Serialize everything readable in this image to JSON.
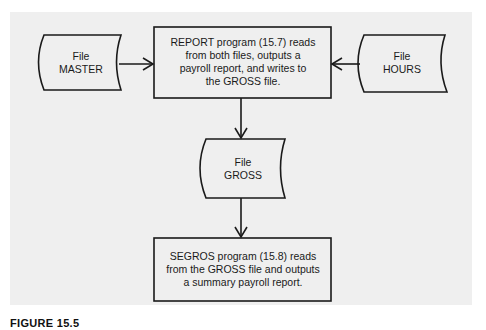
{
  "diagram": {
    "nodes": [
      {
        "id": "master",
        "type": "file",
        "lines": [
          "File",
          "MASTER"
        ]
      },
      {
        "id": "report",
        "type": "process",
        "lines": [
          "REPORT program (15.7) reads",
          "from both files, outputs a",
          "payroll report, and writes to",
          "the GROSS file."
        ]
      },
      {
        "id": "hours",
        "type": "file",
        "lines": [
          "File",
          "HOURS"
        ]
      },
      {
        "id": "gross",
        "type": "file",
        "lines": [
          "File",
          "GROSS"
        ]
      },
      {
        "id": "segros",
        "type": "process",
        "lines": [
          "SEGROS program (15.8) reads",
          "from the GROSS file and outputs",
          "a summary payroll report."
        ]
      }
    ],
    "edges": [
      {
        "from": "master",
        "to": "report"
      },
      {
        "from": "hours",
        "to": "report"
      },
      {
        "from": "report",
        "to": "gross"
      },
      {
        "from": "gross",
        "to": "segros"
      }
    ],
    "colors": {
      "panel": "#efefef",
      "stroke": "#1a1a1a",
      "text": "#1a1a1a"
    }
  },
  "caption": {
    "label": "FIGURE 15.5",
    "text": ""
  }
}
